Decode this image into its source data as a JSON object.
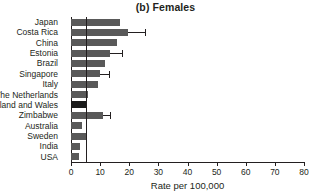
{
  "chart_data": {
    "type": "bar",
    "orientation": "horizontal",
    "title": "(b) Females",
    "xlabel": "Rate per 100,000",
    "ylabel": "",
    "xlim": [
      0,
      80
    ],
    "xticks": [
      0,
      10,
      20,
      30,
      40,
      50,
      60,
      70,
      80
    ],
    "xtick_labels": [
      "0",
      "10",
      "20",
      "30",
      "40",
      "50",
      "60",
      "70",
      "80"
    ],
    "grid": false,
    "legend": "none",
    "reference_line": 5.2,
    "categories": [
      "Japan",
      "Costa Rica",
      "China",
      "Estonia",
      "Brazil",
      "Singapore",
      "Italy",
      "The Netherlands",
      "England and Wales",
      "Zimbabwe",
      "Australia",
      "Sweden",
      "India",
      "USA"
    ],
    "values": [
      16.8,
      19.6,
      15.8,
      13.4,
      11.7,
      10.0,
      9.3,
      5.8,
      5.2,
      11.0,
      3.8,
      5.2,
      3.1,
      2.8
    ],
    "error_upper": [
      null,
      25.5,
      null,
      17.5,
      null,
      13.0,
      null,
      null,
      null,
      13.5,
      null,
      null,
      null,
      null
    ],
    "highlight_index": 8,
    "bar_color": "#595959",
    "highlight_color": "#1a1a1a",
    "axis_color": "#231f20"
  }
}
